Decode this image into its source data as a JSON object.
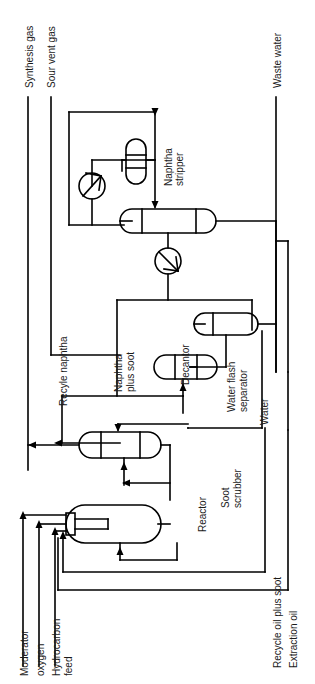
{
  "diagram": {
    "orientation": "rotated-90-ccw",
    "line_color": "#000000",
    "background": "#ffffff",
    "stream_labels": [
      {
        "id": "synthesis-gas",
        "text": "Synthesis gas"
      },
      {
        "id": "sour-vent-gas",
        "text": "Sour vent gas"
      },
      {
        "id": "waste-water",
        "text": "Waste water"
      },
      {
        "id": "recyle-naphtha",
        "text": "Recyle naphtha"
      },
      {
        "id": "naphtha-plus-soot",
        "text": "Naphtha\nplus soot"
      },
      {
        "id": "water",
        "text": "Water"
      },
      {
        "id": "moderator",
        "text": "Moderator"
      },
      {
        "id": "oxygen",
        "text": "oxygen"
      },
      {
        "id": "hydrocarbon-feed",
        "text": "Hydrocarbon\nfeed"
      },
      {
        "id": "recycle-oil-plus-soot",
        "text": "Recycle oil plus soot"
      },
      {
        "id": "extraction-oil",
        "text": "Extraction oil"
      }
    ],
    "equipment_labels": [
      {
        "id": "naphtha-stripper",
        "text": "Naphtha\nstripper"
      },
      {
        "id": "decantor",
        "text": "Decantor"
      },
      {
        "id": "water-flash-separator",
        "text": "Water flash\nseparator"
      },
      {
        "id": "soot-scrubber",
        "text": "Soot\nscrubber"
      },
      {
        "id": "reactor",
        "text": "Reactor"
      }
    ],
    "equipment": [
      {
        "id": "reflux-drum",
        "shape": "vertical-capsule"
      },
      {
        "id": "overhead-condenser",
        "shape": "circle-with-arrow"
      },
      {
        "id": "naphtha-stripper-vessel",
        "shape": "horizontal-capsule"
      },
      {
        "id": "bottoms-cooler",
        "shape": "circle-with-arrow"
      },
      {
        "id": "water-flash-separator-vessel",
        "shape": "horizontal-capsule"
      },
      {
        "id": "decantor-vessel",
        "shape": "horizontal-capsule-partitioned"
      },
      {
        "id": "soot-scrubber-vessel",
        "shape": "horizontal-capsule"
      },
      {
        "id": "reactor-vessel",
        "shape": "horizontal-capsule-with-burner"
      }
    ]
  }
}
